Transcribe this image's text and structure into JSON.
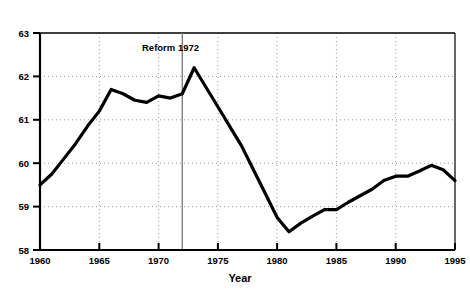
{
  "chart_data": {
    "type": "line",
    "title": "",
    "subtitle": "",
    "xlabel": "Year",
    "ylabel": "",
    "xlim": [
      1960,
      1995
    ],
    "ylim": [
      58,
      63
    ],
    "grid": true,
    "legend": null,
    "x_tick_labels": [
      "1960",
      "1965",
      "1970",
      "1975",
      "1980",
      "1985",
      "1990",
      "1995"
    ],
    "x_ticks": [
      1960,
      1965,
      1970,
      1975,
      1980,
      1985,
      1990,
      1995
    ],
    "y_tick_labels": [
      "58",
      "59",
      "60",
      "61",
      "62",
      "63"
    ],
    "y_ticks": [
      58,
      59,
      60,
      61,
      62,
      63
    ],
    "x": [
      1960,
      1961,
      1962,
      1963,
      1964,
      1965,
      1966,
      1967,
      1968,
      1969,
      1970,
      1971,
      1972,
      1973,
      1974,
      1975,
      1976,
      1977,
      1978,
      1979,
      1980,
      1981,
      1982,
      1983,
      1984,
      1985,
      1986,
      1987,
      1988,
      1989,
      1990,
      1991,
      1992,
      1993,
      1994,
      1995
    ],
    "values": [
      59.5,
      59.75,
      60.1,
      60.45,
      60.85,
      61.2,
      61.7,
      61.6,
      61.45,
      61.4,
      61.55,
      61.5,
      61.6,
      62.2,
      61.75,
      61.3,
      60.85,
      60.4,
      59.85,
      59.3,
      58.75,
      58.42,
      58.62,
      58.78,
      58.93,
      58.93,
      59.1,
      59.25,
      59.4,
      59.6,
      59.7,
      59.7,
      59.82,
      59.95,
      59.85,
      59.6
    ],
    "series": [
      {
        "name": "value",
        "color": "#000000",
        "values": [
          59.5,
          59.75,
          60.1,
          60.45,
          60.85,
          61.2,
          61.7,
          61.6,
          61.45,
          61.4,
          61.55,
          61.5,
          61.6,
          62.2,
          61.75,
          61.3,
          60.85,
          60.4,
          59.85,
          59.3,
          58.75,
          58.42,
          58.62,
          58.78,
          58.93,
          58.93,
          59.1,
          59.25,
          59.4,
          59.6,
          59.7,
          59.7,
          59.82,
          59.95,
          59.85,
          59.6
        ]
      }
    ],
    "annotations": [
      {
        "text": "Reform 1972",
        "x": 1972,
        "type": "vline-with-label",
        "line_color": "#808080",
        "label_x": 1969.2,
        "label_y": 62.55
      }
    ],
    "colors": {
      "line": "#000000",
      "axis": "#000000",
      "grid": "#999999",
      "annotation_line": "#808080",
      "background": "#ffffff"
    }
  }
}
